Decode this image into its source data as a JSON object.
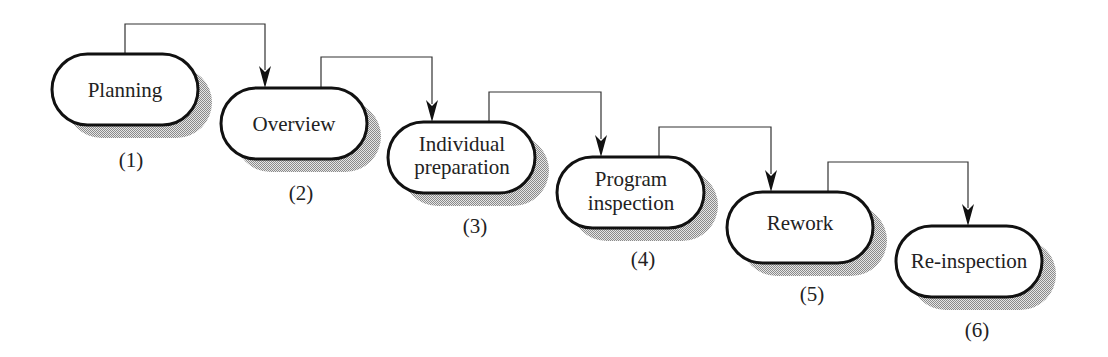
{
  "diagram": {
    "type": "process-flow",
    "colors": {
      "stroke": "#111111",
      "fill": "#ffffff",
      "shadow_dark": "#8a8a8a",
      "shadow_light": "#e6e6e6",
      "connector": "#333333"
    },
    "steps": [
      {
        "id": 1,
        "lines": [
          "Planning"
        ],
        "number_label": "(1)"
      },
      {
        "id": 2,
        "lines": [
          "Overview"
        ],
        "number_label": "(2)"
      },
      {
        "id": 3,
        "lines": [
          "Individual",
          "preparation"
        ],
        "number_label": "(3)"
      },
      {
        "id": 4,
        "lines": [
          "Program",
          "inspection"
        ],
        "number_label": "(4)"
      },
      {
        "id": 5,
        "lines": [
          "Rework"
        ],
        "number_label": "(5)"
      },
      {
        "id": 6,
        "lines": [
          "Re-inspection"
        ],
        "number_label": "(6)"
      }
    ],
    "connections": [
      {
        "from": 1,
        "to": 2
      },
      {
        "from": 2,
        "to": 3
      },
      {
        "from": 3,
        "to": 4
      },
      {
        "from": 4,
        "to": 5
      },
      {
        "from": 5,
        "to": 6
      }
    ]
  }
}
